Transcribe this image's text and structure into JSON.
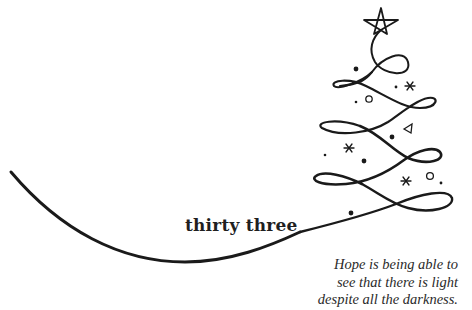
{
  "page": {
    "heading": "thirty three",
    "quote_lines": [
      "Hope is being able to",
      "see that there is light",
      "despite all the darkness."
    ]
  },
  "illustration": {
    "subject": "christmas-tree-swirl",
    "ink_color": "#1a1a1a",
    "background": "#ffffff",
    "decorations": [
      "star-icon",
      "snowflake-icon",
      "circle-ornament",
      "triangle-ornament",
      "dot-ornament"
    ]
  }
}
